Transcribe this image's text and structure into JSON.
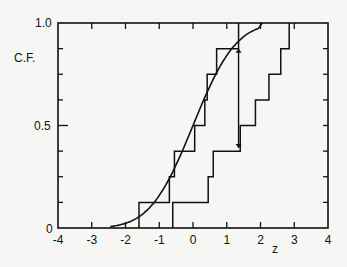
{
  "chart_data": {
    "type": "line",
    "title": "",
    "xlabel": "z",
    "ylabel": "C.F.",
    "xlim": [
      -4,
      4
    ],
    "ylim": [
      0,
      1.0
    ],
    "x_ticks": [
      "-4",
      "-3",
      "-2",
      "-1",
      "0",
      "1",
      "2",
      "3",
      "4"
    ],
    "y_tick_labels": [
      "0",
      "0.5",
      "1.0"
    ],
    "grid": false,
    "legend": null,
    "series": [
      {
        "name": "Theoretical normal CDF",
        "style": "smooth curve",
        "x": [
          -2.5,
          -2.0,
          -1.5,
          -1.0,
          -0.5,
          0.0,
          0.5,
          1.0,
          1.5,
          2.0,
          2.5
        ],
        "values": [
          0.006,
          0.023,
          0.067,
          0.159,
          0.309,
          0.5,
          0.691,
          0.841,
          0.933,
          0.977,
          0.994
        ]
      },
      {
        "name": "Sample empirical CDF (fitting)",
        "style": "step",
        "x": [
          -1.6,
          -0.7,
          -0.55,
          0.05,
          0.35,
          0.42,
          0.7,
          1.35
        ],
        "values": [
          0.125,
          0.25,
          0.375,
          0.5,
          0.625,
          0.75,
          0.875,
          1.0
        ]
      },
      {
        "name": "Sample empirical CDF (shifted)",
        "style": "step",
        "x": [
          -0.6,
          0.45,
          0.6,
          1.4,
          1.85,
          2.25,
          2.6,
          2.85
        ],
        "values": [
          0.125,
          0.25,
          0.375,
          0.5,
          0.625,
          0.75,
          0.875,
          1.0
        ]
      }
    ],
    "annotations": [
      {
        "type": "arrow",
        "x": 1.35,
        "from_y": 0.875,
        "to_y": 0.39,
        "description": "Maximum deviation between distributions"
      }
    ]
  },
  "axes": {
    "ylabel": "C.F.",
    "xlabel": "z",
    "y_labels": {
      "zero": "0",
      "half": "0.5",
      "one": "1.0"
    },
    "x_labels": [
      "-4",
      "-3",
      "-2",
      "-1",
      "0",
      "1",
      "2",
      "3",
      "4"
    ]
  }
}
